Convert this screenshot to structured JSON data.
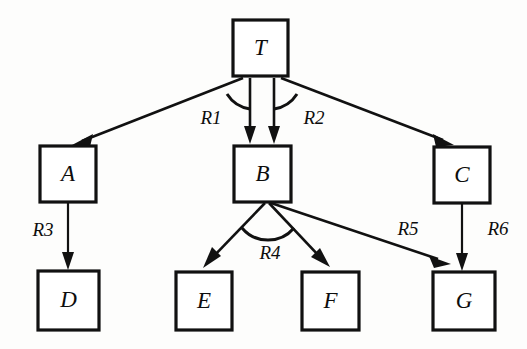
{
  "diagram": {
    "background_color": "#fdfdfc",
    "stroke_color": "#111111",
    "node_fill": "#ffffff",
    "nodes": [
      {
        "id": "T",
        "label": "T",
        "x": 233,
        "y": 20,
        "w": 55,
        "h": 56
      },
      {
        "id": "A",
        "label": "A",
        "x": 40,
        "y": 146,
        "w": 56,
        "h": 56
      },
      {
        "id": "B",
        "label": "B",
        "x": 234,
        "y": 146,
        "w": 57,
        "h": 56
      },
      {
        "id": "C",
        "label": "C",
        "x": 434,
        "y": 147,
        "w": 56,
        "h": 56
      },
      {
        "id": "D",
        "label": "D",
        "x": 38,
        "y": 271,
        "w": 61,
        "h": 59
      },
      {
        "id": "E",
        "label": "E",
        "x": 176,
        "y": 272,
        "w": 56,
        "h": 58
      },
      {
        "id": "F",
        "label": "F",
        "x": 302,
        "y": 272,
        "w": 57,
        "h": 58
      },
      {
        "id": "G",
        "label": "G",
        "x": 433,
        "y": 272,
        "w": 62,
        "h": 58
      }
    ],
    "edges": [
      {
        "id": "e-t-a",
        "from": "T",
        "to": "A",
        "label": "",
        "label_x": 0,
        "label_y": 0
      },
      {
        "id": "e-t-b1",
        "from": "T",
        "to": "B",
        "label": "",
        "label_x": 0,
        "label_y": 0
      },
      {
        "id": "e-t-b2",
        "from": "T",
        "to": "B",
        "label": "",
        "label_x": 0,
        "label_y": 0
      },
      {
        "id": "e-t-c",
        "from": "T",
        "to": "C",
        "label": "",
        "label_x": 0,
        "label_y": 0
      },
      {
        "id": "e-a-d",
        "from": "A",
        "to": "D",
        "label": "R3",
        "label_x": 43,
        "label_y": 232
      },
      {
        "id": "e-b-e",
        "from": "B",
        "to": "E",
        "label": "",
        "label_x": 0,
        "label_y": 0
      },
      {
        "id": "e-b-f",
        "from": "B",
        "to": "F",
        "label": "",
        "label_x": 0,
        "label_y": 0
      },
      {
        "id": "e-b-g",
        "from": "B",
        "to": "G",
        "label": "R5",
        "label_x": 408,
        "label_y": 231
      },
      {
        "id": "e-c-g",
        "from": "C",
        "to": "G",
        "label": "R6",
        "label_x": 498,
        "label_y": 231
      }
    ],
    "relation_labels": [
      {
        "id": "R1",
        "text": "R1",
        "x": 211,
        "y": 120
      },
      {
        "id": "R2",
        "text": "R2",
        "x": 314,
        "y": 120
      },
      {
        "id": "R3",
        "text": "R3",
        "x": 43,
        "y": 232
      },
      {
        "id": "R4",
        "text": "R4",
        "x": 270,
        "y": 255
      },
      {
        "id": "R5",
        "text": "R5",
        "x": 408,
        "y": 231
      },
      {
        "id": "R6",
        "text": "R6",
        "x": 498,
        "y": 231
      }
    ],
    "arcs": [
      {
        "id": "arc-R1",
        "relation": "R1",
        "center_x": 260,
        "center_y": 78,
        "radius": 31
      },
      {
        "id": "arc-R2",
        "relation": "R2",
        "center_x": 262,
        "center_y": 78,
        "radius": 31
      },
      {
        "id": "arc-R4",
        "relation": "R4",
        "center_x": 267,
        "center_y": 203,
        "radius": 34
      }
    ]
  }
}
